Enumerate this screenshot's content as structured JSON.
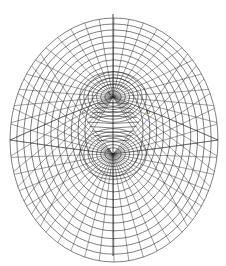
{
  "figure": {
    "title": "",
    "colors": {
      "background": "#ffffff",
      "ink": "#2a2a2a",
      "axis": "#1a1a1a"
    },
    "sources": [
      {
        "label": "A",
        "cx": 113,
        "cy": 97
      },
      {
        "label": "B",
        "cx": 113,
        "cy": 154
      }
    ],
    "side_labels": [
      {
        "label": "C",
        "x": 82,
        "y": 114
      },
      {
        "label": "D",
        "x": 146,
        "y": 114
      }
    ],
    "outer_boundary": {
      "cx": 114,
      "cy": 140,
      "rx": 104,
      "ry": 122
    },
    "axis": {
      "x": 113,
      "y1": 14,
      "y2": 256
    }
  }
}
